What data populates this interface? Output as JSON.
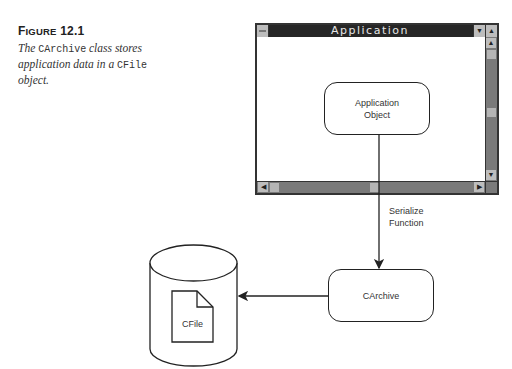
{
  "caption": {
    "figure_label_big": "F",
    "figure_label_small": "IGURE",
    "figure_number": "12.1",
    "text_1": "The ",
    "code_1": "CArchive",
    "text_2": " class stores application data in a ",
    "code_2": "CFile",
    "text_3": " object."
  },
  "window": {
    "title": "Application",
    "sysmenu_icon": "system-menu-icon",
    "minimize_glyph": "▼",
    "maximize_glyph": "▲",
    "scroll_up_glyph": "▲",
    "scroll_down_glyph": "▼",
    "scroll_left_glyph": "◀",
    "scroll_right_glyph": "▶"
  },
  "diagram": {
    "app_object_label_1": "Application",
    "app_object_label_2": "Object",
    "arrow_label_1": "Serialize",
    "arrow_label_2": "Function",
    "carchive_label": "CArchive",
    "cfile_label": "CFile",
    "colors": {
      "line": "#222222",
      "titlebar": "#262626",
      "scroll_track": "#7a7a7a",
      "scroll_button": "#bdbdbd"
    }
  }
}
